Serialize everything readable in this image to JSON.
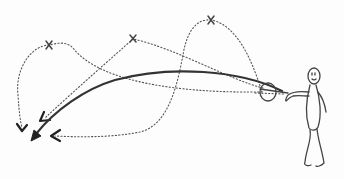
{
  "diagram": {
    "colors": {
      "background": "#fdfdfd",
      "ink": "#333333",
      "dotted": "#555555"
    },
    "waypoints": [
      {
        "label": "x",
        "cx": 49,
        "cy": 45
      },
      {
        "label": "x",
        "cx": 133,
        "cy": 39
      },
      {
        "label": "x",
        "cx": 211,
        "cy": 20
      }
    ],
    "elements": {
      "figure": "stick-figure",
      "ball": "circle",
      "main_path": "solid-arc-arrow",
      "alt_paths": 3
    }
  }
}
